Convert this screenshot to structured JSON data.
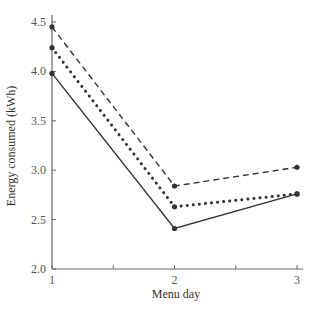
{
  "chart_data": {
    "type": "line",
    "title": "",
    "xlabel": "Menu day",
    "ylabel": "Energy consumed (kWh)",
    "x": [
      1,
      2,
      3
    ],
    "xticks": [
      "1",
      "2",
      "3"
    ],
    "yticks": [
      "2.0",
      "2.5",
      "3.0",
      "3.5",
      "4.0",
      "4.5"
    ],
    "xlim": [
      1,
      3
    ],
    "ylim": [
      2.0,
      4.5
    ],
    "grid": false,
    "legend": null,
    "series": [
      {
        "name": "dashed",
        "style": "dashed",
        "values": [
          4.45,
          2.84,
          3.03
        ]
      },
      {
        "name": "dotted",
        "style": "dotted",
        "values": [
          4.24,
          2.63,
          2.76
        ]
      },
      {
        "name": "solid",
        "style": "solid",
        "values": [
          3.98,
          2.41,
          2.76
        ]
      }
    ]
  },
  "colors": {
    "line": "#333333",
    "axis": "#666666"
  }
}
